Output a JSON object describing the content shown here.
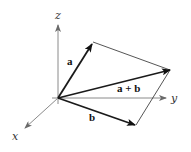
{
  "diagram": {
    "origin": [
      58,
      98
    ],
    "axes": [
      {
        "name": "z",
        "label": "z",
        "end": [
          58,
          25
        ],
        "label_pos": [
          55,
          19
        ]
      },
      {
        "name": "y",
        "label": "y",
        "end": [
          166,
          98
        ],
        "label_pos": [
          171,
          102
        ]
      },
      {
        "name": "x",
        "label": "x",
        "end": [
          25,
          128
        ],
        "label_pos": [
          12,
          140
        ]
      }
    ],
    "vectors": [
      {
        "name": "a",
        "label": "a",
        "tip": [
          92,
          44
        ],
        "label_pos": [
          67,
          65
        ]
      },
      {
        "name": "a+b",
        "label": "a + b",
        "tip": [
          170,
          70
        ],
        "label_pos": [
          117,
          92
        ]
      },
      {
        "name": "b",
        "label": "b",
        "tip": [
          135,
          125
        ],
        "label_pos": [
          89,
          121
        ]
      }
    ],
    "parallelogram": {
      "corners": [
        [
          58,
          98
        ],
        [
          93,
          42
        ],
        [
          170,
          70
        ],
        [
          136,
          125
        ]
      ]
    },
    "colors": {
      "axis": "#8a8a8a",
      "vector": "#1a1a1a",
      "edge": "#2a2a2a",
      "background": "#ffffff"
    }
  }
}
